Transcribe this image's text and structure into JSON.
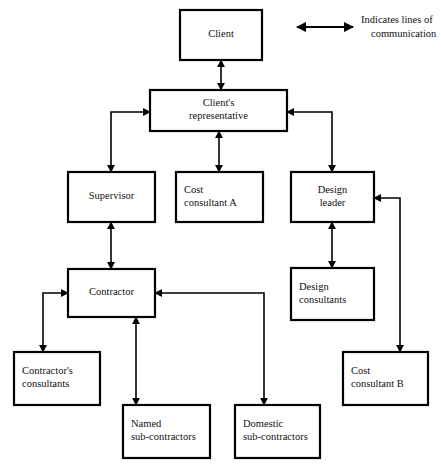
{
  "diagram": {
    "legend": {
      "icon": "double-headed-arrow-icon",
      "line1": "Indicates lines of",
      "line2": "communication"
    },
    "colors": {
      "background": "#ffffff",
      "box_stroke": "#000000",
      "box_fill": "#ffffff",
      "connector": "#000000",
      "text": "#111111"
    },
    "nodes": [
      {
        "id": "client",
        "label_lines": [
          "Client"
        ],
        "align": "center",
        "x": 180,
        "y": 10,
        "w": 82,
        "h": 50
      },
      {
        "id": "clients-representative",
        "label_lines": [
          "Client's",
          "representative"
        ],
        "align": "center",
        "x": 150,
        "y": 90,
        "w": 137,
        "h": 41
      },
      {
        "id": "supervisor",
        "label_lines": [
          "Supervisor"
        ],
        "align": "center",
        "x": 68,
        "y": 172,
        "w": 87,
        "h": 50
      },
      {
        "id": "cost-consultant-a",
        "label_lines": [
          "Cost",
          "consultant A"
        ],
        "align": "left",
        "x": 176,
        "y": 172,
        "w": 87,
        "h": 50
      },
      {
        "id": "design-leader",
        "label_lines": [
          "Design",
          "leader"
        ],
        "align": "center",
        "x": 291,
        "y": 172,
        "w": 83,
        "h": 50
      },
      {
        "id": "contractor",
        "label_lines": [
          "Contractor"
        ],
        "align": "center",
        "x": 68,
        "y": 269,
        "w": 87,
        "h": 48
      },
      {
        "id": "design-consultants",
        "label_lines": [
          "Design",
          "consultants"
        ],
        "align": "left",
        "x": 291,
        "y": 268,
        "w": 83,
        "h": 52
      },
      {
        "id": "contractors-consultants",
        "label_lines": [
          "Contractor's",
          "consultants"
        ],
        "align": "left",
        "x": 14,
        "y": 352,
        "w": 86,
        "h": 53
      },
      {
        "id": "cost-consultant-b",
        "label_lines": [
          "Cost",
          "consultant B"
        ],
        "align": "left",
        "x": 343,
        "y": 352,
        "w": 85,
        "h": 53
      },
      {
        "id": "named-sub-contractors",
        "label_lines": [
          "Named",
          "sub-contractors"
        ],
        "align": "left",
        "x": 123,
        "y": 405,
        "w": 87,
        "h": 53
      },
      {
        "id": "domestic-sub-contractors",
        "label_lines": [
          "Domestic",
          "sub-contractors"
        ],
        "align": "left",
        "x": 235,
        "y": 405,
        "w": 85,
        "h": 53
      }
    ],
    "connectors": [
      {
        "id": "client-to-clients-representative",
        "from": "client",
        "to": "clients-representative",
        "arrows": "both",
        "path": "M 221 60 L 221 90"
      },
      {
        "id": "clients-representative-to-supervisor",
        "from": "clients-representative",
        "to": "supervisor",
        "arrows": "both",
        "path": "M 150 112 L 111 112 L 111 172"
      },
      {
        "id": "clients-representative-to-cost-consultant-a",
        "from": "clients-representative",
        "to": "cost-consultant-a",
        "arrows": "both",
        "path": "M 219 131 L 219 172"
      },
      {
        "id": "clients-representative-to-design-leader",
        "from": "clients-representative",
        "to": "design-leader",
        "arrows": "both",
        "path": "M 287 112 L 332 112 L 332 172"
      },
      {
        "id": "supervisor-to-contractor",
        "from": "supervisor",
        "to": "contractor",
        "arrows": "both",
        "path": "M 111 222 L 111 269"
      },
      {
        "id": "design-leader-to-design-consultants",
        "from": "design-leader",
        "to": "design-consultants",
        "arrows": "both",
        "path": "M 332 222 L 332 268"
      },
      {
        "id": "cost-consultant-b-to-design-leader",
        "from": "cost-consultant-b",
        "to": "design-leader",
        "arrows": "both",
        "path": "M 374 198 L 400 198 L 400 352"
      },
      {
        "id": "contractor-to-contractors-consultants",
        "from": "contractor",
        "to": "contractors-consultants",
        "arrows": "both",
        "path": "M 68 293 L 43 293 L 43 352"
      },
      {
        "id": "contractor-to-named-sub-contractors",
        "from": "contractor",
        "to": "named-sub-contractors",
        "arrows": "both",
        "path": "M 136 317 L 136 405"
      },
      {
        "id": "contractor-to-domestic-sub-contractors",
        "from": "contractor",
        "to": "domestic-sub-contractors",
        "arrows": "both",
        "path": "M 155 293 L 264 293 L 264 405"
      }
    ]
  }
}
